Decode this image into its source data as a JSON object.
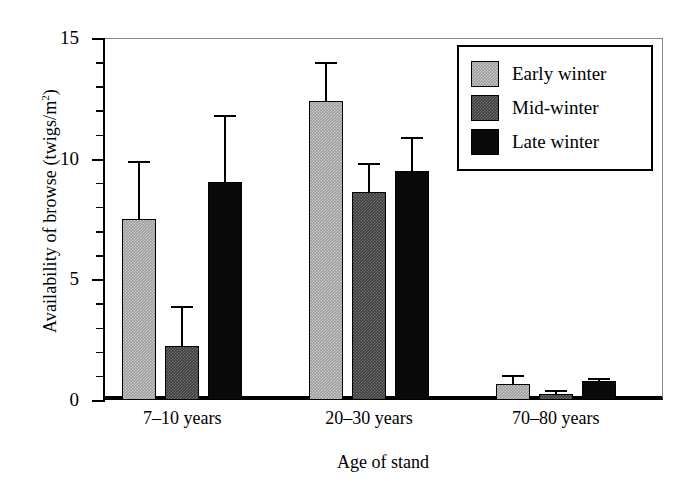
{
  "chart_data": {
    "type": "bar",
    "title": "",
    "subtitle": "",
    "xlabel": "Age of stand",
    "ylabel": "Availability of browse (twigs/m²)",
    "ylabel_parts": {
      "main": "Availability of browse (twigs/m",
      "sup": "2",
      "tail": ")"
    },
    "categories": [
      "7–10 years",
      "20–30 years",
      "70–80 years"
    ],
    "series": [
      {
        "name": "Early winter",
        "color": "#9d9d9d",
        "fill": "light-gray-stipple",
        "values": [
          7.5,
          12.4,
          0.65
        ],
        "errors_upper": [
          9.9,
          14.0,
          1.05
        ]
      },
      {
        "name": "Mid-winter",
        "color": "#3f3f3f",
        "fill": "dark-gray-stipple",
        "values": [
          2.25,
          8.6,
          0.25
        ],
        "errors_upper": [
          3.9,
          9.8,
          0.4
        ]
      },
      {
        "name": "Late winter",
        "color": "#0a0a0a",
        "fill": "black",
        "values": [
          9.05,
          9.5,
          0.8
        ],
        "errors_upper": [
          11.8,
          10.9,
          0.9
        ]
      }
    ],
    "ylim": [
      0,
      15
    ],
    "xlim": [
      0,
      3
    ],
    "y_major_ticks": [
      0,
      5,
      10,
      15
    ],
    "y_minor_tick_step": 1,
    "y_tick_labels": [
      "0",
      "5",
      "10",
      "15"
    ],
    "grid": false,
    "legend_position": "top-right",
    "error_bar_style": "upper-only-with-cap"
  },
  "legend": {
    "entries": [
      {
        "label": "Early winter",
        "swatch": "early"
      },
      {
        "label": "Mid-winter",
        "swatch": "mid"
      },
      {
        "label": "Late winter",
        "swatch": "late"
      }
    ]
  }
}
